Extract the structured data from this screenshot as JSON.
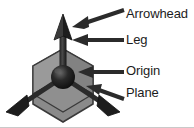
{
  "figure": {
    "type": "labeled-diagram",
    "background_color": "#ffffff",
    "border_color": "#c9c9c9"
  },
  "colors": {
    "plane_fill": "#8a8a8a",
    "plane_fill_light": "#9a9a9a",
    "plane_fill_dark": "#7c7c7c",
    "plane_stroke": "#3a3a3a",
    "leg_dark": "#2b2b2b",
    "leg_mid": "#3c3c3c",
    "origin_dark": "#141414",
    "origin_highlight": "#6a6a6a",
    "callout_arrow": "#2b2b2b",
    "label_text": "#1c1c1c"
  },
  "labels": [
    {
      "id": "arrowhead",
      "text": "Arrowhead",
      "target": "tip of the vertical axis arrow"
    },
    {
      "id": "leg",
      "text": "Leg",
      "target": "shaft of the vertical axis"
    },
    {
      "id": "origin",
      "text": "Origin",
      "target": "central sphere where axes meet"
    },
    {
      "id": "plane",
      "text": "Plane",
      "target": "shaded hexagonal face"
    }
  ],
  "gizmo": {
    "origin_point": {
      "x": 63,
      "y": 77
    },
    "legs": [
      {
        "name": "up-axis",
        "direction": "up",
        "has_arrowhead": true
      },
      {
        "name": "lower-left-axis",
        "direction": "down-left",
        "has_arrowhead": true
      },
      {
        "name": "lower-right-axis",
        "direction": "down-right",
        "has_arrowhead": true
      }
    ],
    "plane_shape": "hexagon",
    "plane_faces": 3
  },
  "callout_arrows": [
    {
      "id": "arrowhead-arrow",
      "style": "diagonal",
      "points_to": "arrowhead"
    },
    {
      "id": "leg-arrow",
      "style": "horizontal",
      "points_to": "leg"
    },
    {
      "id": "origin-arrow",
      "style": "horizontal",
      "points_to": "origin"
    },
    {
      "id": "plane-arrow",
      "style": "diagonal",
      "points_to": "plane"
    }
  ]
}
